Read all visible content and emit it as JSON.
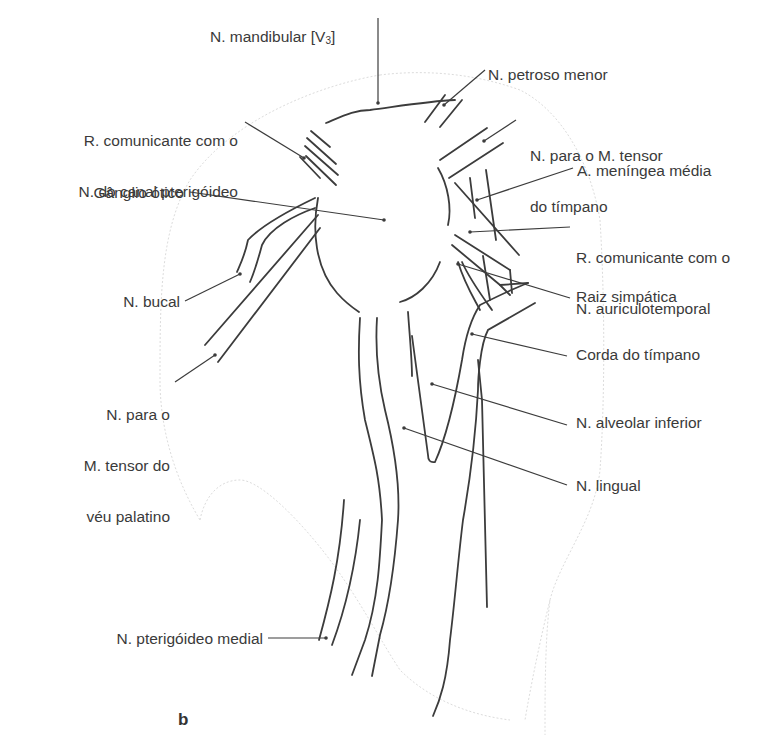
{
  "figure": {
    "panel_letter": "b",
    "colors": {
      "line": "#3c3c3c",
      "outline": "#d6d6d6",
      "text": "#3a3a3a"
    }
  },
  "labels": {
    "mandibular": {
      "text": "N. mandibular [V",
      "sub": "3",
      "close": "]"
    },
    "petroso_menor": "N. petroso menor",
    "r_comunicante_pterigoideo": {
      "line1": "R. comunicante com o",
      "line2": "N. do canal pterigóideo"
    },
    "tensor_timpano": {
      "line1": "N. para o M. tensor",
      "line2": "do tímpano"
    },
    "meningea_media": "A. meníngea média",
    "ganglio_otico": "Gânglio ótico",
    "r_comunicante_auriculotemporal": {
      "line1": "R. comunicante com o",
      "line2": "N. auriculotemporal"
    },
    "bucal": "N. bucal",
    "raiz_simpatica": "Raiz simpática",
    "corda_timpano": "Corda do tímpano",
    "tensor_veu": {
      "line1": "N. para o",
      "line2": "M. tensor do",
      "line3": "véu palatino"
    },
    "alveolar_inferior": "N. alveolar inferior",
    "lingual": "N. lingual",
    "pterigoideo_medial": "N. pterigóideo medial"
  }
}
